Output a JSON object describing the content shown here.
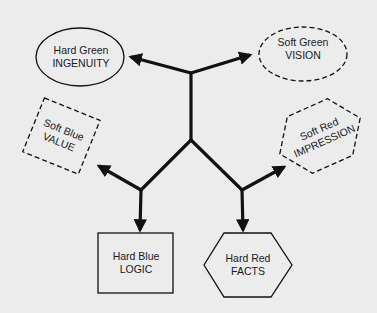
{
  "diagram": {
    "type": "branching-tree",
    "colors": {
      "background": "#ececec",
      "stroke": "#111111",
      "text": "#1a1a1a"
    },
    "nodes": [
      {
        "id": "ingenuity",
        "line1": "Hard Green",
        "line2": "INGENUITY",
        "shape": "ellipse",
        "border": "solid"
      },
      {
        "id": "vision",
        "line1": "Soft Green",
        "line2": "VISION",
        "shape": "ellipse",
        "border": "dashed"
      },
      {
        "id": "value",
        "line1": "Soft Blue",
        "line2": "VALUE",
        "shape": "rotated-square",
        "border": "dashed"
      },
      {
        "id": "impression",
        "line1": "Soft Red",
        "line2": "IMPRESSION",
        "shape": "rotated-hexagon",
        "border": "dashed"
      },
      {
        "id": "logic",
        "line1": "Hard Blue",
        "line2": "LOGIC",
        "shape": "rectangle",
        "border": "solid"
      },
      {
        "id": "facts",
        "line1": "Hard Red",
        "line2": "FACTS",
        "shape": "hexagon",
        "border": "solid"
      }
    ],
    "edges": [
      {
        "from": "top-junction",
        "to": "ingenuity"
      },
      {
        "from": "top-junction",
        "to": "vision"
      },
      {
        "from": "left-junction",
        "to": "value"
      },
      {
        "from": "left-junction",
        "to": "logic"
      },
      {
        "from": "right-junction",
        "to": "impression"
      },
      {
        "from": "right-junction",
        "to": "facts"
      }
    ]
  }
}
